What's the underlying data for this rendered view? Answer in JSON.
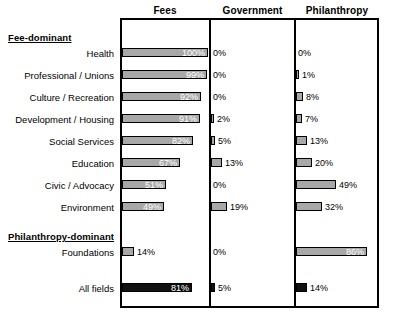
{
  "chart_data": {
    "type": "bar",
    "title": "",
    "subtitle": "",
    "xlabel": "",
    "ylabel": "",
    "xlim": [
      0,
      100
    ],
    "grid": false,
    "legend_position": "none",
    "orientation": "horizontal",
    "unit": "%",
    "columns": [
      "Fees",
      "Government",
      "Philanthropy"
    ],
    "groups": [
      {
        "heading": "Fee-dominant",
        "categories": [
          "Health",
          "Professional / Unions",
          "Culture / Recreation",
          "Development / Housing",
          "Social Services",
          "Education",
          "Civic / Advocacy",
          "Environment"
        ],
        "series": [
          {
            "name": "Fees",
            "values": [
              100,
              99,
              92,
              91,
              82,
              67,
              51,
              49
            ]
          },
          {
            "name": "Government",
            "values": [
              0,
              0,
              0,
              2,
              5,
              13,
              0,
              19
            ]
          },
          {
            "name": "Philanthropy",
            "values": [
              0,
              1,
              8,
              7,
              13,
              20,
              49,
              32
            ]
          }
        ]
      },
      {
        "heading": "Philanthropy-dominant",
        "categories": [
          "Foundations"
        ],
        "series": [
          {
            "name": "Fees",
            "values": [
              14
            ]
          },
          {
            "name": "Government",
            "values": [
              0
            ]
          },
          {
            "name": "Philanthropy",
            "values": [
              86
            ]
          }
        ]
      },
      {
        "heading": "",
        "categories": [
          "All fields"
        ],
        "total_row": true,
        "series": [
          {
            "name": "Fees",
            "values": [
              81
            ]
          },
          {
            "name": "Government",
            "values": [
              5
            ]
          },
          {
            "name": "Philanthropy",
            "values": [
              14
            ]
          }
        ]
      }
    ],
    "labels": {
      "fees": [
        "100%",
        "99%",
        "92%",
        "91%",
        "82%",
        "67%",
        "51%",
        "49%",
        "14%",
        "81%"
      ],
      "government": [
        "0%",
        "0%",
        "0%",
        "2%",
        "5%",
        "13%",
        "0%",
        "19%",
        "0%",
        "5%"
      ],
      "philanthropy": [
        "0%",
        "1%",
        "8%",
        "7%",
        "13%",
        "20%",
        "49%",
        "32%",
        "86%",
        "14%"
      ]
    },
    "colors": {
      "bar_fill": "#a8a8a8",
      "bar_total_fill": "#111111",
      "bar_stroke": "#000000",
      "frame": "#000000",
      "background": "#ffffff",
      "text": "#000000",
      "inside_label_text": "#ffffff"
    }
  }
}
